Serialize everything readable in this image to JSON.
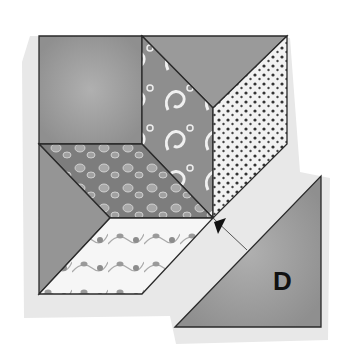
{
  "illustration": {
    "subject": "quilt block assembly diagram",
    "piece_label": "D",
    "colors": {
      "background": "#ffffff",
      "shadow": "#e6e6e6",
      "solid_gray": "#9a9a9a",
      "mid_gray": "#8a8a8a",
      "light_fabric": "#f4f4f4",
      "outline": "#2a2a2a",
      "label": "#111111"
    }
  }
}
